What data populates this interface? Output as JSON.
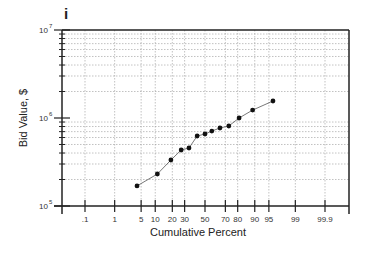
{
  "chart_data": {
    "type": "line",
    "panel_label": "i",
    "title": "",
    "xlabel": "Cumulative Percent",
    "ylabel": "Bid Value, $",
    "x_scale": "probability",
    "y_scale": "log",
    "ylim": [
      100000,
      10000000
    ],
    "x_ticks": [
      ".1",
      "1",
      "5",
      "10",
      "20",
      "30",
      "50",
      "70",
      "80",
      "90",
      "95",
      "99",
      "99.9"
    ],
    "y_ticks": [
      {
        "base": "10",
        "exp": "5"
      },
      {
        "base": "10",
        "exp": "6"
      },
      {
        "base": "10",
        "exp": "7"
      }
    ],
    "grid": true,
    "legend": null,
    "series": [
      {
        "name": "Bid values",
        "x": [
          4,
          11,
          19,
          27,
          34,
          42,
          50,
          57,
          65,
          73,
          81,
          89,
          96
        ],
        "y": [
          169000,
          231000,
          333000,
          433000,
          456000,
          624000,
          658000,
          711000,
          770000,
          811000,
          1000000,
          1230000,
          1560000
        ]
      }
    ]
  }
}
